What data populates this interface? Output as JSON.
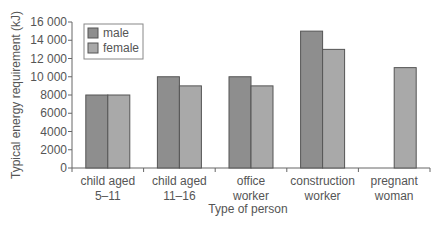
{
  "chart_data": {
    "type": "bar",
    "title": "",
    "xlabel": "Type of person",
    "ylabel": "Typical energy requirement (kJ)",
    "ylim": [
      0,
      16000
    ],
    "yticks": [
      0,
      2000,
      4000,
      6000,
      8000,
      10000,
      12000,
      14000,
      16000
    ],
    "ytick_labels": [
      "0",
      "2000",
      "4000",
      "6000",
      "8000",
      "10 000",
      "12 000",
      "14 000",
      "16 000"
    ],
    "categories": [
      [
        "child aged",
        "5–11"
      ],
      [
        "child aged",
        "11–16"
      ],
      [
        "office",
        "worker"
      ],
      [
        "construction",
        "worker"
      ],
      [
        "pregnant",
        "woman"
      ]
    ],
    "series": [
      {
        "name": "male",
        "color": "#8e8e8e",
        "values": [
          8000,
          10000,
          10000,
          15000,
          null
        ]
      },
      {
        "name": "female",
        "color": "#a9a9a9",
        "values": [
          8000,
          9000,
          9000,
          13000,
          11000
        ]
      }
    ],
    "grid": false,
    "legend_position": "top-left inside"
  }
}
